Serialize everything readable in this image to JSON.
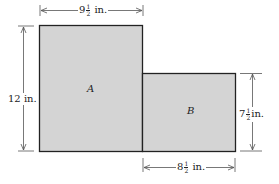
{
  "diagram": {
    "shapes": [
      {
        "id": "A",
        "label": "A",
        "fill": "#d4d4d4"
      },
      {
        "id": "B",
        "label": "B",
        "fill": "#d4d4d4"
      }
    ],
    "dimensions": {
      "top": {
        "whole": "9",
        "num": "1",
        "den": "2",
        "unit": "in."
      },
      "left": {
        "text": "12 in."
      },
      "right": {
        "whole": "7",
        "num": "1",
        "den": "2",
        "unit": "in."
      },
      "bottom": {
        "whole": "8",
        "num": "1",
        "den": "2",
        "unit": "in."
      }
    },
    "colors": {
      "fill": "#d4d4d4",
      "stroke": "#222222",
      "dim_line": "#555555"
    }
  }
}
